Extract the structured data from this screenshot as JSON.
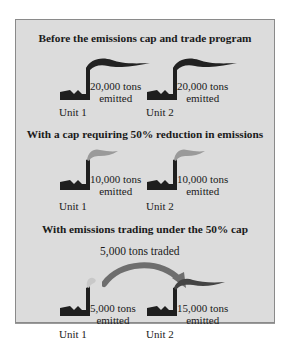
{
  "colors": {
    "panel_bg": "#dcdcdc",
    "factory": "#1f1f1f",
    "smoke_dark": "#222222",
    "smoke_gray": "#9a9a9a",
    "smoke_light": "#c8c8c8",
    "arrow": "#6e6e6e"
  },
  "sections": [
    {
      "title": "Before the emissions cap and trade program",
      "units": [
        {
          "name": "Unit 1",
          "emission_line1": "20,000 tons",
          "emission_line2": "emitted",
          "smoke": "large-dark"
        },
        {
          "name": "Unit 2",
          "emission_line1": "20,000 tons",
          "emission_line2": "emitted",
          "smoke": "large-dark"
        }
      ]
    },
    {
      "title": "With a cap requiring 50% reduction in emissions",
      "units": [
        {
          "name": "Unit 1",
          "emission_line1": "10,000 tons",
          "emission_line2": "emitted",
          "smoke": "medium-gray"
        },
        {
          "name": "Unit 2",
          "emission_line1": "10,000 tons",
          "emission_line2": "emitted",
          "smoke": "medium-gray"
        }
      ]
    },
    {
      "title": "With emissions trading under the 50% cap",
      "trade_label": "5,000 tons traded",
      "units": [
        {
          "name": "Unit 1",
          "emission_line1": "5,000 tons",
          "emission_line2": "emitted",
          "smoke": "small-light"
        },
        {
          "name": "Unit 2",
          "emission_line1": "15,000 tons",
          "emission_line2": "emitted",
          "smoke": "large-dark"
        }
      ]
    }
  ]
}
